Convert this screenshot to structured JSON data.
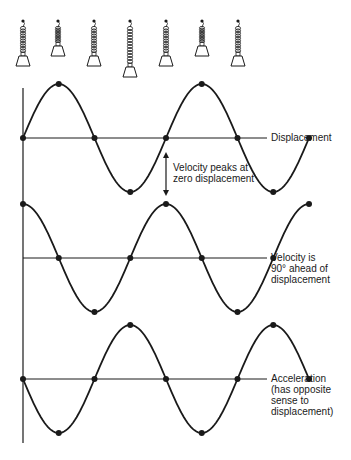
{
  "diagram": {
    "ink_color": "#1a1a1a",
    "background": "#ffffff",
    "axis": {
      "x": 23,
      "top": 88,
      "bottom": 443
    },
    "quarter_period_px": 35.75,
    "springs": [
      {
        "x": 23,
        "state": "rest",
        "weight_bottom": 66
      },
      {
        "x": 58,
        "state": "compressed",
        "weight_bottom": 56
      },
      {
        "x": 94,
        "state": "rest",
        "weight_bottom": 66
      },
      {
        "x": 130,
        "state": "stretched",
        "weight_bottom": 77
      },
      {
        "x": 166,
        "state": "rest",
        "weight_bottom": 66
      },
      {
        "x": 202,
        "state": "compressed",
        "weight_bottom": 56
      },
      {
        "x": 238,
        "state": "rest",
        "weight_bottom": 66
      }
    ],
    "curves": [
      {
        "name": "displacement",
        "zero_y": 138,
        "amplitude": 54,
        "phase": "sin",
        "label": "Displacement"
      },
      {
        "name": "velocity",
        "zero_y": 258,
        "amplitude": 54,
        "phase": "cos",
        "label": "Velocity is\n90° ahead of\ndisplacement"
      },
      {
        "name": "acceleration",
        "zero_y": 379,
        "amplitude": 54,
        "phase": "-sin",
        "label": "Acceleration\n(has opposite\nsense to\ndisplacement)"
      }
    ],
    "annotation": {
      "text": "Velocity peaks at\nzero displacement",
      "arrow_x": 166,
      "arrow_top": 152,
      "arrow_bottom": 196
    }
  }
}
